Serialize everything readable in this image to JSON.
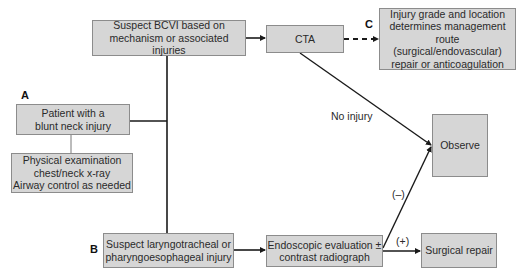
{
  "diagram": {
    "nodes": {
      "suspect_bcvi": "Suspect BCVI based on\nmechanism or associated injuries",
      "cta": "CTA",
      "injury_grade": "Injury grade and location\ndetermines management\nroute (surgical/endovascular)\nrepair or anticoagulation",
      "patient": "Patient with a\nblunt neck injury",
      "physical": "Physical examination\nchest/neck x-ray\nAirway control as needed",
      "observe": "Observe",
      "suspect_laryngo": "Suspect laryngotracheal or\npharyngoesophageal injury",
      "endoscopic": "Endoscopic evaluation ±\ncontrast radiograph",
      "surgical": "Surgical repair"
    },
    "markers": {
      "a": "A",
      "b": "B",
      "c": "C"
    },
    "edge_labels": {
      "no_injury": "No injury",
      "negative": "(–)",
      "positive": "(+)"
    },
    "colors": {
      "box_fill": "#d6d6d6",
      "box_border": "#8c8c8c",
      "line": "#1a1a1a"
    }
  }
}
